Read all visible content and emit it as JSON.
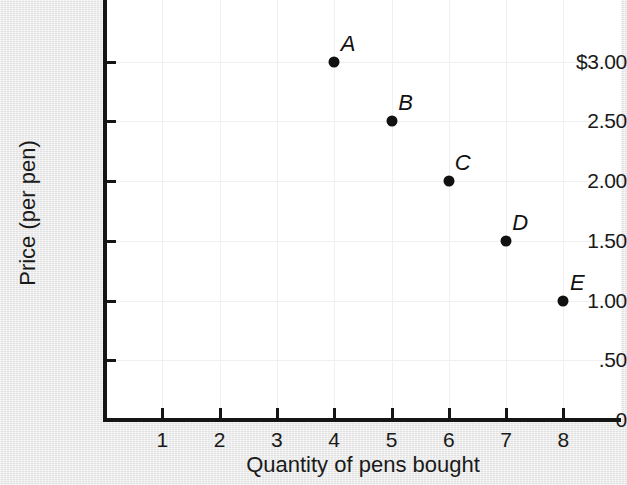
{
  "chart_data": {
    "type": "scatter",
    "title": "",
    "xlabel": "Quantity of pens bought",
    "ylabel": "Price (per pen)",
    "xlim": [
      0,
      9
    ],
    "ylim": [
      0,
      3.5
    ],
    "grid": true,
    "legend": "none",
    "x_tick_labels": [
      "1",
      "2",
      "3",
      "4",
      "5",
      "6",
      "7",
      "8"
    ],
    "x_tick_values": [
      1,
      2,
      3,
      4,
      5,
      6,
      7,
      8
    ],
    "y_tick_labels": [
      "0",
      ".50",
      "1.00",
      "1.50",
      "2.00",
      "2.50",
      "$3.00"
    ],
    "y_tick_values": [
      0,
      0.5,
      1.0,
      1.5,
      2.0,
      2.5,
      3.0
    ],
    "points": [
      {
        "label": "A",
        "x": 4,
        "y": 3.0
      },
      {
        "label": "B",
        "x": 5,
        "y": 2.5
      },
      {
        "label": "C",
        "x": 6,
        "y": 2.0
      },
      {
        "label": "D",
        "x": 7,
        "y": 1.5
      },
      {
        "label": "E",
        "x": 8,
        "y": 1.0
      }
    ],
    "marker_color": "#111111",
    "plot_background": "#ffffff",
    "page_background": "#e9e9e9",
    "gridline_color": "#f0f0f0",
    "axis_color": "#151515"
  }
}
